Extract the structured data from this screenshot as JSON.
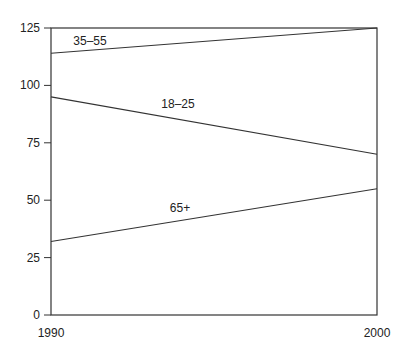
{
  "chart_data": {
    "type": "line",
    "title": "",
    "xlabel": "",
    "ylabel": "",
    "x": [
      1990,
      2000
    ],
    "x_tick_labels": [
      "1990",
      "2000"
    ],
    "y_ticks": [
      0,
      25,
      50,
      75,
      100,
      125
    ],
    "y_tick_labels": [
      "0",
      "25",
      "50",
      "75",
      "100",
      "125"
    ],
    "ylim": [
      0,
      125
    ],
    "xlim": [
      1990,
      2000
    ],
    "grid": false,
    "legend": "inline labels",
    "series": [
      {
        "name": "35–55",
        "values": [
          114,
          125
        ]
      },
      {
        "name": "18–25",
        "values": [
          95,
          70
        ]
      },
      {
        "name": "65+",
        "values": [
          32,
          55
        ]
      }
    ]
  }
}
